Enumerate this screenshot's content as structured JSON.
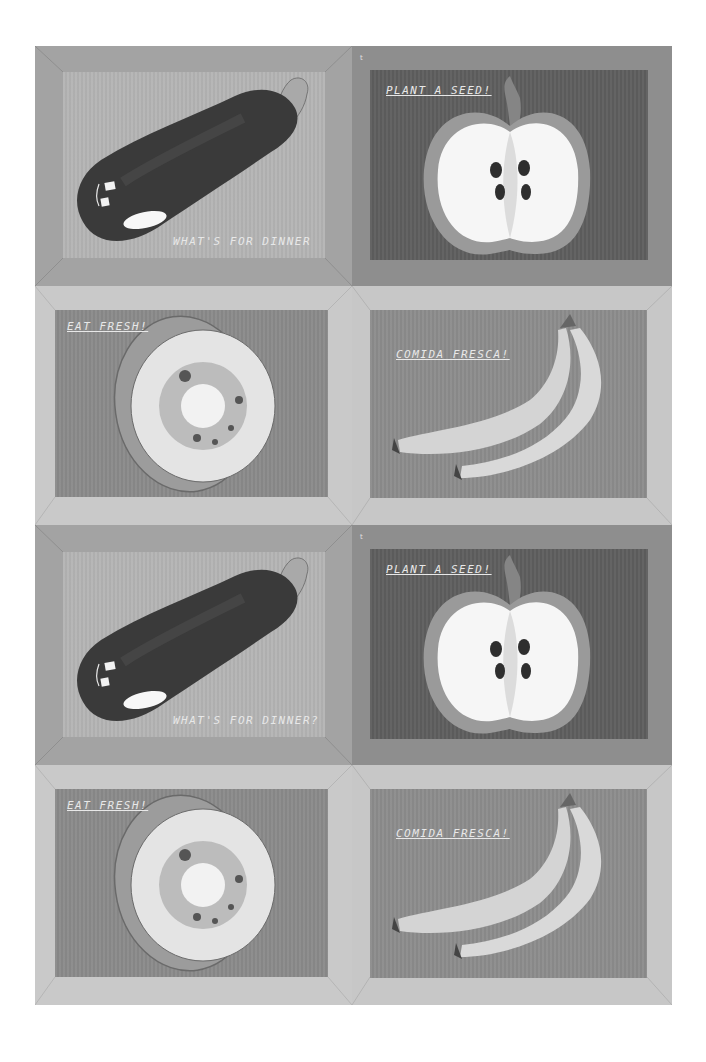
{
  "image": {
    "description": "Grayscale sheet of eight printed placemats arranged in a 2x4 grid, each with a watercolor fruit/vegetable illustration and a hand-lettered caption",
    "colors": {
      "background": "#ffffff",
      "eggplant_frame": "#a3a3a3",
      "eggplant_inner": "#b4b4b4",
      "apple_frame": "#8e8e8e",
      "apple_inner": "#5e5e5e",
      "kiwi_frame": "#c9c9c9",
      "kiwi_inner": "#8a8a8a",
      "banana_frame": "#c7c7c7",
      "banana_inner": "#8c8c8c",
      "caption": "#e8e8e8"
    }
  },
  "placemats": [
    {
      "subject": "eggplant",
      "caption": "WHAT'S FOR DINNER"
    },
    {
      "subject": "apple-half",
      "caption": "PLANT A SEED!"
    },
    {
      "subject": "kiwi-slice",
      "caption": "EAT FRESH!"
    },
    {
      "subject": "bananas",
      "caption": "COMIDA FRESCA!"
    },
    {
      "subject": "eggplant",
      "caption": "WHAT'S FOR DINNER?"
    },
    {
      "subject": "apple-half",
      "caption": "PLANT A SEED!"
    },
    {
      "subject": "kiwi-slice",
      "caption": "EAT FRESH!"
    },
    {
      "subject": "bananas",
      "caption": "COMIDA FRESCA!"
    }
  ]
}
